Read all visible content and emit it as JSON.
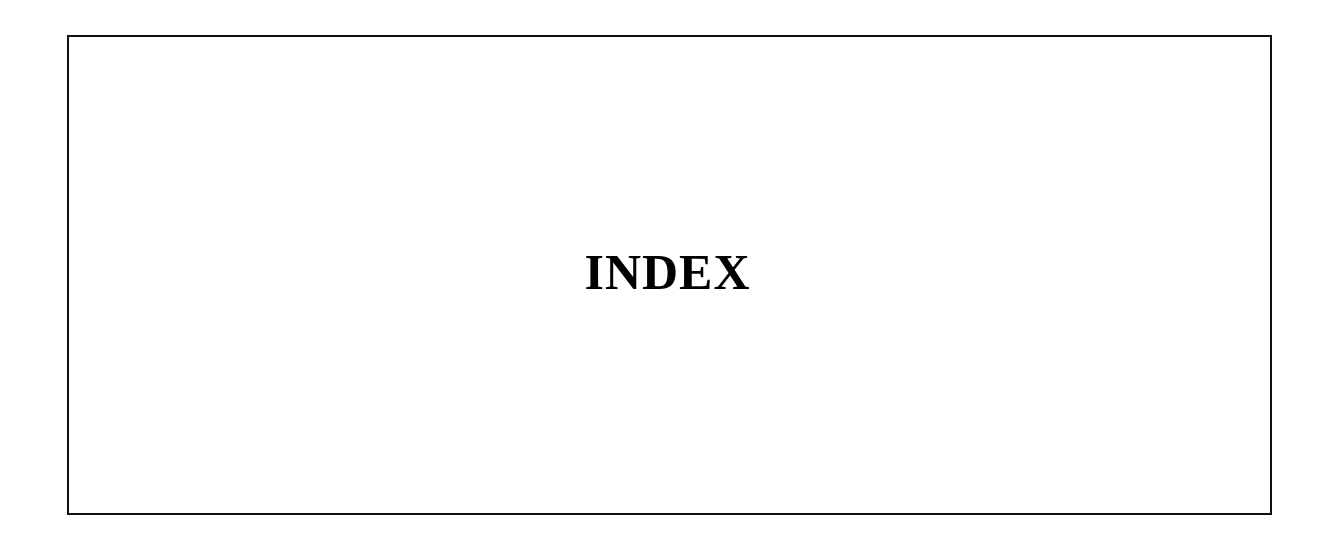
{
  "page": {
    "title": "INDEX"
  },
  "colors": {
    "border": "#111111",
    "text": "#000000",
    "background": "#ffffff"
  }
}
